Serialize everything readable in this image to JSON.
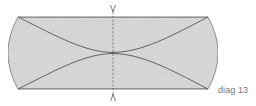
{
  "caption": "diag 13",
  "figure": {
    "colors": {
      "fill": "#d6d6d6",
      "outline": "#6f6f6f",
      "curves": "#5a5a5a",
      "axis": "#6a6a6a",
      "caption": "#777777"
    }
  }
}
